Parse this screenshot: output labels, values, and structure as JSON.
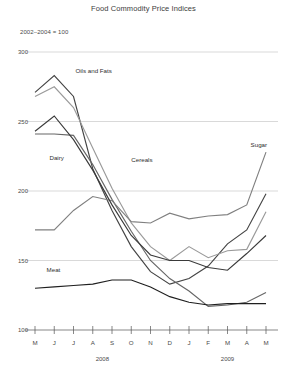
{
  "chart_data": {
    "type": "line",
    "title": "Food Commodity Price Indices",
    "subtitle": "2002–2004 = 100",
    "xlabel": "",
    "ylabel": "",
    "ylim": [
      100,
      300
    ],
    "yticks": [
      100,
      150,
      200,
      250,
      300
    ],
    "ytick_labels": [
      "100",
      "150",
      "200",
      "250",
      "300"
    ],
    "grid": true,
    "legend_position": "inline-annotations",
    "categories": [
      "M",
      "J",
      "J",
      "A",
      "S",
      "O",
      "N",
      "D",
      "J",
      "F",
      "M",
      "A",
      "M"
    ],
    "x": [
      "M",
      "J",
      "J",
      "A",
      "S",
      "O",
      "N",
      "D",
      "J",
      "F",
      "M",
      "A",
      "M"
    ],
    "period_labels": [
      {
        "label": "2008",
        "span": "M 2008 – D 2008"
      },
      {
        "label": "2009",
        "span": "J 2009 – M 2009"
      }
    ],
    "series": [
      {
        "name": "Oils and Fats",
        "color": "#444444",
        "label_x_index": 2.1,
        "label_y_value": 285,
        "values": [
          271,
          283,
          268,
          216,
          186,
          160,
          142,
          133,
          137,
          146,
          162,
          172,
          198
        ]
      },
      {
        "name": "Cereals",
        "color": "#9a9a9a",
        "label_x_index": 5.0,
        "label_y_value": 221,
        "values": [
          268,
          275,
          260,
          231,
          202,
          177,
          160,
          150,
          160,
          152,
          157,
          158,
          185
        ]
      },
      {
        "name": "Dairy",
        "color": "#666666",
        "label_x_index": 0.75,
        "label_y_value": 222,
        "values": [
          241,
          241,
          240,
          219,
          194,
          171,
          150,
          137,
          128,
          117,
          118,
          120,
          127
        ]
      },
      {
        "name": "Sugar",
        "color": "#808080",
        "label_x_index": 11.2,
        "label_y_value": 232,
        "values": [
          172,
          172,
          186,
          196,
          193,
          178,
          177,
          184,
          180,
          182,
          183,
          190,
          228
        ]
      },
      {
        "name": "Meat",
        "color": "#1f1f1f",
        "label_x_index": 0.6,
        "label_y_value": 142,
        "values": [
          130,
          131,
          132,
          133,
          136,
          136,
          131,
          124,
          120,
          118,
          119,
          119,
          119
        ]
      },
      {
        "name": "Cereals-dark",
        "color": "#3a3a3a",
        "hidden_label": true,
        "values": [
          243,
          254,
          237,
          215,
          190,
          168,
          154,
          150,
          150,
          145,
          143,
          155,
          168
        ]
      }
    ],
    "colors": {
      "grid": "#c9c9c9",
      "axis": "#555555",
      "text": "#3c3c3c",
      "background": "#ffffff"
    }
  }
}
